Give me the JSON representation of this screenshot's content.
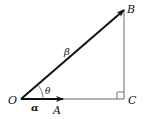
{
  "diagram": {
    "type": "right-triangle-vectors",
    "points": {
      "O": {
        "label": "O",
        "x": 21,
        "y": 99
      },
      "A": {
        "label": "A",
        "x": 63,
        "y": 99
      },
      "B": {
        "label": "B",
        "x": 124,
        "y": 10
      },
      "C": {
        "label": "C",
        "x": 124,
        "y": 99
      }
    },
    "vectors": [
      {
        "name": "alpha",
        "label": "α",
        "from": "O",
        "to": "A"
      },
      {
        "name": "beta",
        "label": "β",
        "from": "O",
        "to": "B"
      }
    ],
    "angle": {
      "label": "θ",
      "vertex": "O"
    },
    "right_angle_at": "C",
    "colors": {
      "ink": "#111111",
      "thin_line": "#444444"
    }
  }
}
